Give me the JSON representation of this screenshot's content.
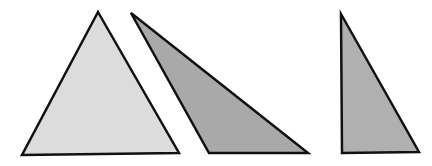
{
  "diagram": {
    "stroke_color": "#111111",
    "triangles": [
      {
        "name": "acute-triangle",
        "fill": "#dcdcdc",
        "points": "98,12 179,153 22,155"
      },
      {
        "name": "obtuse-triangle",
        "fill": "#a9a9a9",
        "points": "131,13 308,153 209,153"
      },
      {
        "name": "right-triangle",
        "fill": "#b0b0b0",
        "points": "341,14 419,152 342,153"
      }
    ]
  }
}
